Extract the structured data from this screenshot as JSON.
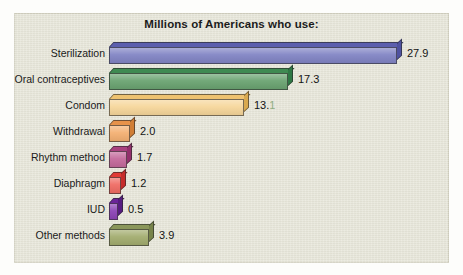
{
  "chart_data": {
    "type": "bar",
    "orientation": "horizontal",
    "title": "Millions of Americans who use:",
    "xlabel": "",
    "ylabel": "",
    "xlim": [
      0,
      27.9
    ],
    "grid": false,
    "legend": "none",
    "categories": [
      "Sterilization",
      "Oral contraceptives",
      "Condom",
      "Withdrawal",
      "Rhythm method",
      "Diaphragm",
      "IUD",
      "Other methods"
    ],
    "values": [
      27.9,
      17.3,
      13.1,
      2.0,
      1.7,
      1.2,
      0.5,
      3.9
    ],
    "value_labels": [
      "27.9",
      "17.3",
      "13.1",
      "2.0",
      "1.7",
      "1.2",
      "0.5",
      "3.9"
    ],
    "bar_colors": [
      "#8184c4",
      "#6aa371",
      "#f6d69a",
      "#f4b072",
      "#c4699b",
      "#ef6b63",
      "#8c43b6",
      "#a2ac6e"
    ],
    "bar_top_colors": [
      "#5c5fae",
      "#3f8a52",
      "#eec270",
      "#e7924a",
      "#a9417e",
      "#e13a36",
      "#6b2499",
      "#8a965a"
    ],
    "bar_side_colors": [
      "#4f52a0",
      "#2f7845",
      "#d9a94f",
      "#d07e36",
      "#93306c",
      "#c62b2a",
      "#571c80",
      "#77834a"
    ],
    "panel_color": "#e6e5d8",
    "background_color": "#fdfdfb",
    "text_color": "#1a1a1a"
  }
}
